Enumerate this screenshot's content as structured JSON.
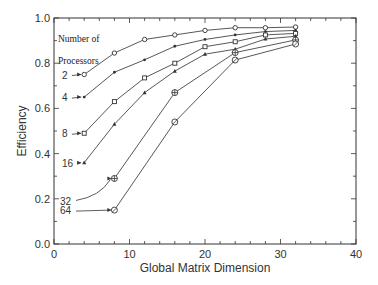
{
  "chart_data": {
    "type": "line",
    "title": "",
    "xlabel": "Global Matrix Dimension",
    "ylabel": "Efficiency",
    "xlim": [
      0,
      40
    ],
    "ylim": [
      0.0,
      1.0
    ],
    "xticks": [
      "0",
      "10",
      "20",
      "30",
      "40"
    ],
    "yticks": [
      "0.0",
      "0.2",
      "0.4",
      "0.6",
      "0.8",
      "1.0"
    ],
    "grid": false,
    "legend": {
      "position": "inline annotations (left, arrows pointing to first point)",
      "title": [
        "Number of",
        "Processors"
      ]
    },
    "series": [
      {
        "name": "2",
        "x": [
          4,
          8,
          12,
          16,
          20,
          24,
          28,
          32
        ],
        "values": [
          0.75,
          0.845,
          0.905,
          0.925,
          0.945,
          0.957,
          0.957,
          0.96
        ]
      },
      {
        "name": "4",
        "x": [
          4,
          8,
          12,
          16,
          20,
          24,
          28,
          32
        ],
        "values": [
          0.65,
          0.76,
          0.815,
          0.875,
          0.905,
          0.925,
          0.94,
          0.945
        ]
      },
      {
        "name": "8",
        "x": [
          4,
          8,
          12,
          16,
          20,
          24,
          28,
          32
        ],
        "values": [
          0.49,
          0.63,
          0.735,
          0.8,
          0.873,
          0.895,
          0.925,
          0.932
        ]
      },
      {
        "name": "16",
        "x": [
          4,
          8,
          12,
          16,
          20,
          24,
          28,
          32
        ],
        "values": [
          0.36,
          0.53,
          0.67,
          0.765,
          0.84,
          0.862,
          0.907,
          0.919
        ]
      },
      {
        "name": "32",
        "x": [
          8,
          16,
          24,
          32
        ],
        "values": [
          0.29,
          0.67,
          0.847,
          0.903
        ]
      },
      {
        "name": "64",
        "x": [
          8,
          16,
          24,
          32
        ],
        "values": [
          0.15,
          0.54,
          0.814,
          0.885
        ]
      }
    ]
  },
  "colors": {
    "line": "#444444",
    "axis": "#333333",
    "background": "#ffffff"
  }
}
